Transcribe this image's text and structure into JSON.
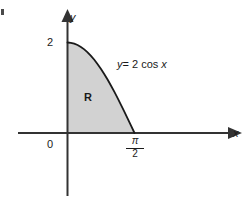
{
  "figure": {
    "background_color": "#ffffff",
    "axis_color": "#333333",
    "curve_color": "#1a1a1a",
    "fill_color": "#d2d2d2",
    "text_color": "#1a1a1a"
  },
  "axes": {
    "y_axis_label": "y",
    "x_axis_label": "x",
    "origin_label": "0",
    "y_tick_label": "2",
    "x_tick_numerator": "π",
    "x_tick_denominator": "2"
  },
  "region": {
    "label": "R"
  },
  "curve": {
    "equation_lhs": "y",
    "equation_eq": "= 2 cos",
    "equation_var": "x",
    "equation_full": "y = 2 cos x"
  },
  "chart_data": {
    "type": "area",
    "title": "",
    "xlabel": "x",
    "ylabel": "y",
    "function": "y = 2 cos x",
    "xlim": [
      0,
      1.5707963
    ],
    "ylim": [
      0,
      2
    ],
    "x_ticks": [
      0,
      1.5707963
    ],
    "x_tick_labels": [
      "0",
      "π/2"
    ],
    "y_ticks": [
      2
    ],
    "y_tick_labels": [
      "2"
    ],
    "grid": false,
    "legend": false,
    "shaded_region_label": "R",
    "x": [
      0.0,
      0.0785,
      0.1571,
      0.2356,
      0.3142,
      0.3927,
      0.4712,
      0.5498,
      0.6283,
      0.7069,
      0.7854,
      0.8639,
      0.9425,
      1.021,
      1.0996,
      1.1781,
      1.2566,
      1.3352,
      1.4137,
      1.4923,
      1.5708
    ],
    "y": [
      2.0,
      1.9938,
      1.9754,
      1.9446,
      1.9021,
      1.8478,
      1.782,
      1.7053,
      1.618,
      1.5209,
      1.4142,
      1.299,
      1.1756,
      1.045,
      0.908,
      0.7654,
      0.618,
      0.4674,
      0.3129,
      0.1564,
      0.0
    ]
  }
}
